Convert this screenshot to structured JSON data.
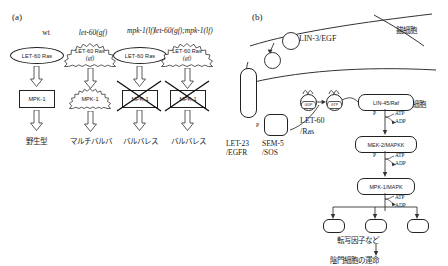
{
  "figure": {
    "panel_a": {
      "label": "(a)",
      "columns": [
        {
          "header": "wt",
          "italic": false,
          "ras_label": "LET-60 Ras",
          "ras_activated": false,
          "ras_gf_suffix": "",
          "mpk_label": "MPK-1",
          "mpk_activated": false,
          "mpk_blocked": false,
          "outcome": "野生型"
        },
        {
          "header": "let-60(gf)",
          "italic": true,
          "ras_label": "LET-60 Ras",
          "ras_activated": true,
          "ras_gf_suffix": "(gf)",
          "mpk_label": "MPK-1",
          "mpk_activated": true,
          "mpk_blocked": false,
          "outcome": "マルチバルバ"
        },
        {
          "header": "mpk-1(lf)",
          "italic": true,
          "ras_label": "LET-60 Ras",
          "ras_activated": false,
          "ras_gf_suffix": "",
          "mpk_label": "MPK-1",
          "mpk_activated": false,
          "mpk_blocked": true,
          "outcome": "バルバレス"
        },
        {
          "header": "let-60(gf);mpk-1(lf)",
          "italic": true,
          "ras_label": "LET-60 Ras",
          "ras_activated": true,
          "ras_gf_suffix": "(gf)",
          "mpk_label": "MPK-1",
          "mpk_activated": false,
          "mpk_blocked": true,
          "outcome": "バルバレス"
        }
      ]
    },
    "panel_b": {
      "label": "(b)",
      "anchor_cell": "錨細胞",
      "epithelial_cell": "上皮細胞",
      "ligand": "LIN-3/EGF",
      "receptor": "LET-23\n/EGFR",
      "receptor_line1": "LET-23",
      "receptor_line2": "/EGFR",
      "adaptor_line1": "SEM-5",
      "adaptor_line2": "/SOS",
      "ras_line1": "LET-60",
      "ras_line2": "/Ras",
      "gdp": "GDP",
      "gtp": "GTP",
      "raf": "LIN-45/Raf",
      "mapkk": "MEK-2/MAPKK",
      "mapk": "MPK-1/MAPK",
      "atp": "ATP",
      "adp": "ADP",
      "phospho": "P",
      "transcription_factors": "転写因子など",
      "cell_fate": "陰門細胞の運命"
    }
  }
}
